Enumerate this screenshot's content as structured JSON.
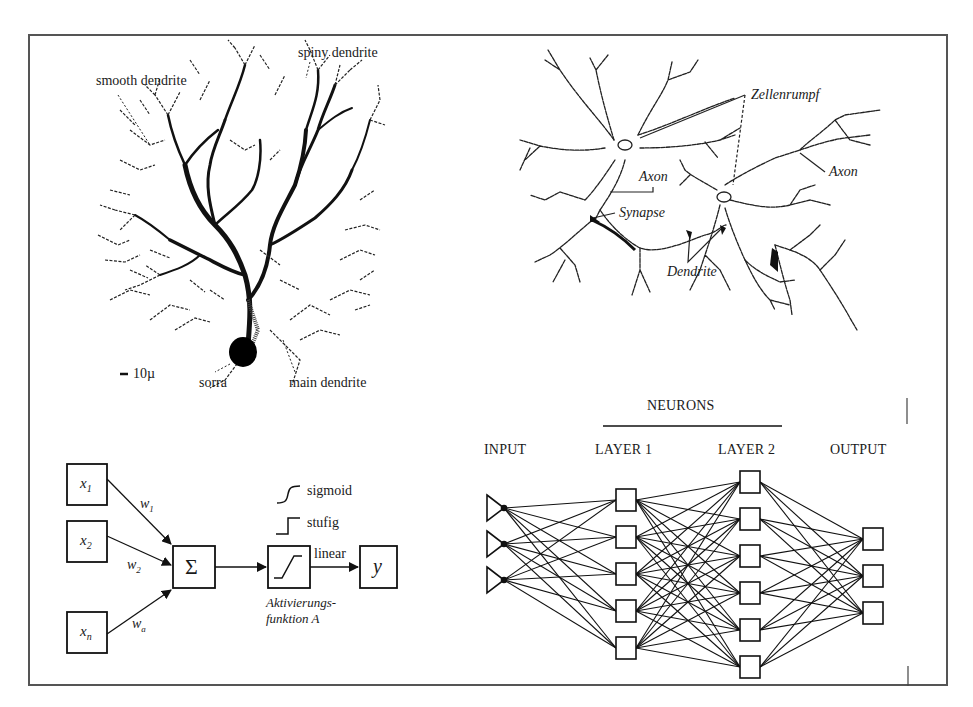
{
  "panels": {
    "purkinje": {
      "labels": {
        "spiny": "spiny dendrite",
        "smooth": "smooth dendrite",
        "scale": "10µ",
        "soma": "sorra",
        "main": "main dendrite"
      }
    },
    "neurons": {
      "labels": {
        "zellenrumpf": "Zellenrumpf",
        "axon_left": "Axon",
        "axon_right": "Axon",
        "synapse": "Synapse",
        "dendrite": "Dendrite"
      }
    },
    "perceptron": {
      "inputs": [
        "x1",
        "x2",
        "xn"
      ],
      "input_labels": [
        {
          "base": "x",
          "sub": "1"
        },
        {
          "base": "x",
          "sub": "2"
        },
        {
          "base": "x",
          "sub": "n"
        }
      ],
      "weights": [
        {
          "base": "w",
          "sub": "1"
        },
        {
          "base": "w",
          "sub": "2"
        },
        {
          "base": "w",
          "sub": "a"
        }
      ],
      "sum_symbol": "Σ",
      "output": "y",
      "activation_types": [
        "sigmoid",
        "stufig",
        "linear"
      ],
      "activation_caption_1": "Aktivierungs-",
      "activation_caption_2": "funktion A"
    },
    "network": {
      "header": "NEURONS",
      "columns": [
        "INPUT",
        "LAYER 1",
        "LAYER 2",
        "OUTPUT"
      ],
      "layer_sizes": [
        3,
        5,
        6,
        3
      ]
    }
  },
  "colors": {
    "ink": "#1a1a1a",
    "frame": "#555555",
    "background": "#ffffff"
  }
}
